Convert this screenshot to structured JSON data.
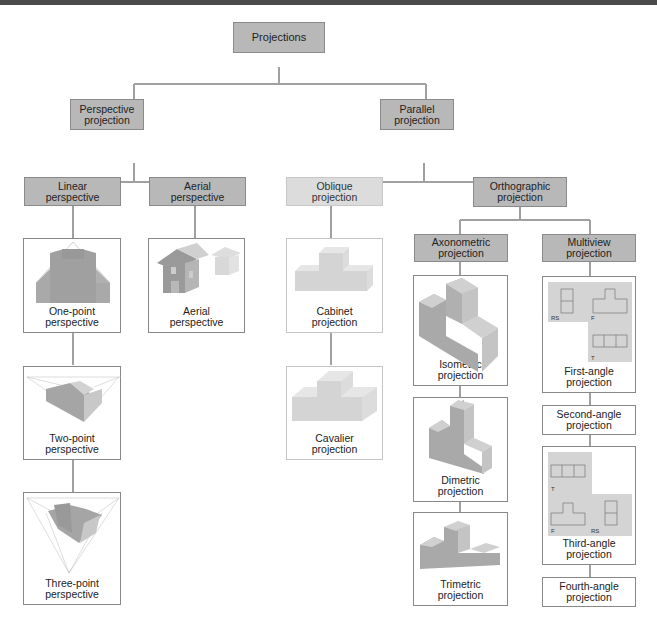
{
  "diagram": {
    "root": "Projections",
    "level1": {
      "perspective": "Perspective projection",
      "parallel": "Parallel projection"
    },
    "perspective_children": {
      "linear": "Linear perspective",
      "aerial": "Aerial perspective"
    },
    "parallel_children": {
      "oblique": "Oblique projection",
      "orthographic": "Orthographic projection"
    },
    "orthographic_children": {
      "axonometric": "Axonometric projection",
      "multiview": "Multiview projection"
    },
    "linear_examples": [
      "One-point perspective",
      "Two-point perspective",
      "Three-point perspective"
    ],
    "aerial_examples": [
      "Aerial perspective"
    ],
    "oblique_examples": [
      "Cabinet projection",
      "Cavalier projection"
    ],
    "axonometric_examples": [
      "Isometric projection",
      "Dimetric projection",
      "Trimetric projection"
    ],
    "multiview_examples": [
      "First-angle projection",
      "Second-angle projection",
      "Third-angle projection",
      "Fourth-angle projection"
    ],
    "view_labels": {
      "rs": "RS",
      "f": "F",
      "t": "T"
    }
  },
  "colors": {
    "box_dark": "#b8b8b8",
    "box_light": "#dcdcdc",
    "connector": "#9a9a9a",
    "shape_dark": "#a9a9a9",
    "shape_light": "#d6d6d6"
  }
}
